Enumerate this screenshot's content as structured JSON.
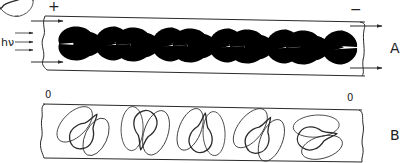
{
  "panels": [
    {
      "id": "A",
      "label": "A",
      "left_electrode": "+",
      "right_electrode": "−",
      "illumination": "hν",
      "cell_count": 5,
      "description": "Cells in tube with applied field; pear-shaped cells with symmetric surrounding field loops and flow arrows"
    },
    {
      "id": "B",
      "label": "B",
      "left_electrode": "0",
      "right_electrode": "0",
      "cell_count": 5,
      "description": "Cells in tube without field; randomly oriented pear-shaped cells with surrounding loops"
    }
  ],
  "colors": {
    "line": "#2a2a2a",
    "background": "#ffffff"
  }
}
